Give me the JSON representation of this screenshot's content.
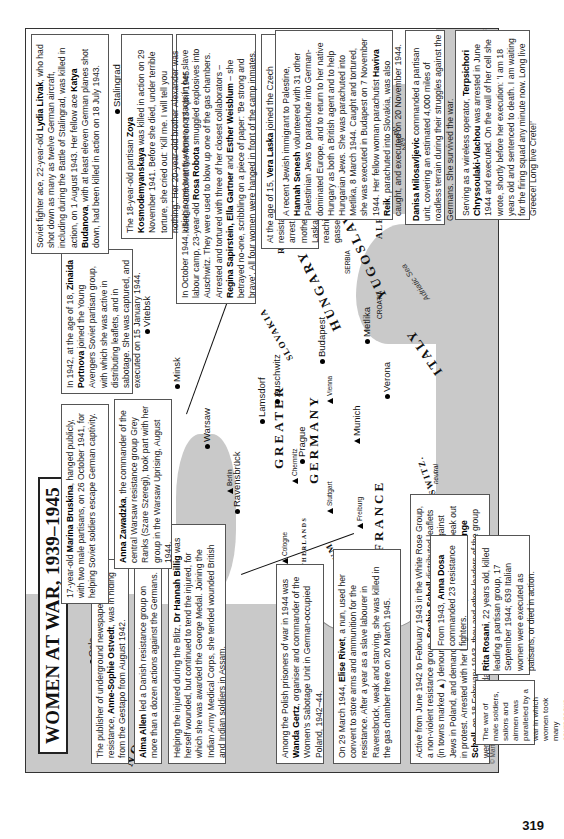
{
  "title": "WOMEN AT WAR, 1939–1945",
  "page_number": "319",
  "credit": "© Martin Gilbert 2008",
  "scale": {
    "km_label": "kilometres",
    "km_ticks": [
      "0",
      "300"
    ],
    "miles_label": "miles",
    "miles_ticks": [
      "0",
      "200"
    ]
  },
  "countries": [
    "NORWAY",
    "DENMARK",
    "THE NETHERLANDS",
    "BELGIUM",
    "FRANCE",
    "SWITZ.",
    "neutral",
    "GREATER",
    "GERMANY",
    "SOVIET UNION",
    "SLOVAKIA",
    "HUNGARY",
    "ROMANIA",
    "YUGOSLAVIA",
    "SERBIA",
    "CROATIA",
    "BULGARIA",
    "ALBANIA",
    "GREECE",
    "ITALY",
    "CRETE",
    "PALESTINE"
  ],
  "seas": [
    "Adriatic Sea",
    "Aegean Sea"
  ],
  "cities": {
    "dots": [
      "Oslo",
      "London",
      "Lyon",
      "Ravensbrück",
      "Warsaw",
      "Minsk",
      "Vitebsk",
      "Prague",
      "Lamsdorf",
      "Auschwitz",
      "Budapest",
      "Metlika",
      "Verona",
      "Osino-Gai",
      "Stalingrad"
    ],
    "triangles": [
      "Hamburg",
      "Cologne",
      "Berlin",
      "Chemnitz",
      "Stuttgart",
      "Freiburg",
      "Munich",
      "Vienna"
    ]
  },
  "boxes": {
    "ostvedt": {
      "pre": "The publisher of underground newspapers for the resistance, ",
      "name": "Anne-Sophie Ostvedt",
      "post": ", was in hiding from the Gestapo from August 1942."
    },
    "allen": {
      "pre": "",
      "name": "Alma Allen",
      "post": " led a Danish resistance group on more than a dozen actions against the Germans."
    },
    "billig": {
      "pre": "Helping the injured during the Blitz, ",
      "name": "Dr Hannah Billig",
      "post": " was herself wounded, but continued to tend the injured, for which she was awarded the George Medal. Joining the Indian Army Medical Corps, she tended wounded British and Indian soldiers in Assam."
    },
    "gertz": {
      "pre": "Among the Polish prisoners of war in 1944 was ",
      "name": "Wanda Gertz",
      "post": ", organiser and commander of the Women's Sabotage Unit in German-occupied Poland, 1942–44."
    },
    "rivet": {
      "pre": "On 29 March 1944, ",
      "name": "Elise Rivet",
      "post": ", a nun, used her convent to store arms and ammunition for the resistance. After a year as a slave labourer in Ravensbrück, weak and starving, she was killed in the gas chamber there on 20 March 1945."
    },
    "scholl": {
      "pre": "Active from June 1942 to February 1943 in the White Rose Group, a non-violent resistance group, ",
      "name": "Sophie Scholl",
      "post": " distributed leaflets (in towns marked ▲) denouncing 'bestial' Nazi atrocities against Jews in Poland, and demanded that the German people speak out in protest. Arrested with her brother Hans, and their sister ",
      "name2": "Inge Scholl",
      "post2": ", on 18 February 1943, they and other leaders of the group were executed four days later."
    },
    "summary": {
      "text": "The war of male soldiers, sailors and airmen was paralleled by a war in which women took many courageous parts. This map shows 24 individual examples of the women at war in Europe."
    },
    "bruskina": {
      "pre": "17-year-old ",
      "name": "Marina Bruskina",
      "post": ", hanged publicly, with two male partisans, on 26 October 1941, for helping Soviet soldiers escape German captivity."
    },
    "zawadzka": {
      "pre": "",
      "name": "Anna Zawadzka",
      "post": ", the commander of the central Warsaw resistance group Grey Ranks (Szare Szeregi), took part with her group in the Warsaw Uprising, August 1944."
    },
    "portnova": {
      "pre": "In 1942, at the age of 18, ",
      "name": "Zinaida Portnova",
      "post": " joined the Young Avengers Soviet partisan group, with which she was active in distributing leaflets, and in sabotage. She was captured, and executed on 15 January 1944."
    },
    "robota": {
      "pre": "In October 1944, using some twenty women contacts in her slave labour camp, 23-year-old ",
      "name": "Rosa Robota",
      "post": " smuggled explosives into Auschwitz. They were used to blow up one of the gas chambers. Arrested and tortured with three of her closest collaborators – ",
      "name2": "Regina Sapirstein, Ella Gartner",
      "mid": " and ",
      "name3": "Esther Weisblum",
      "post2": " – she betrayed no-one, scribbling on a piece of paper: 'Be strong and brave'. All four women were hanged in front of the camp inmates."
    },
    "kosmodemyanskaya": {
      "pre": "The 18-year-old partisan ",
      "name": "Zoya Kosmodemyanskaya",
      "post": " was killed in action on 29 November 1941. Before she died, under terrible torture, she cried out: 'Kill me. I will tell you nothing.' Her 20-year-old brother Alexander was killed in action at the front on 13 April 1945."
    },
    "litvak": {
      "pre": "Soviet fighter ace, 22-year-old ",
      "name": "Lydia Litvak",
      "post": ", who had shot down as many as twelve German aircraft, including during the Battle of Stalingrad, was killed in action, on 1 August 1943. Her fellow ace ",
      "name2": "Katya Budanova",
      "post2": ", with at least eleven German planes shot down, had been killed in action on 18 July 1943."
    },
    "laska": {
      "pre": "At the age of 15, ",
      "name": "Vera Laska",
      "post": " joined the Czech resistance, helping Jews and non-Jews to escape arrest. On the Nazis' 'most wanted' list, after her mother was arrested and taken to Auschwitz, Vera Laska surrendered, and was also taken to Auschwitz, reaching the camp on the day her mother was gassed. She survived the war."
    },
    "senesh": {
      "pre": "A recent Jewish immigrant to Palestine, ",
      "name": "Hannah Senesh",
      "post": " volunteered with 31 other Palestinian Jews to parachute into German-dominated Europe, and to return to her native Hungary as both a British agent and to help Hungarian Jews. She was parachuted into Metlika, 8 March 1944. Caught and tortured, she was executed in Budapest on 7 November 1944. Her fellow woman parachutist ",
      "name2": "Haviva Reik",
      "post2": ", parachuted into Slovakia, was also caught, and executed on 20 November 1944."
    },
    "milosavljevic": {
      "pre": "",
      "name": "Danisa Milosavljevic",
      "post": " commanded a partisan unit, covering an estimated 4,000 miles of roadless terrain during their struggles against the Germans. She survived the war."
    },
    "vlachou": {
      "pre": "Serving as a wireless operator, ",
      "name": "Terpsichori Chryssoulaki-Vlachou",
      "post": " was arrested in June 1944 and executed. On the wall of her cell she wrote, shortly before her execution: 'I am 18 years old and sentenced to death. I am waiting for the firing squad any minute now. Long live Greece! Long live Crete!'"
    },
    "dosa": {
      "pre": "From 1943, ",
      "name": "Anna Dosa",
      "post": " commanded 23 resistance fighters."
    },
    "rosani": {
      "pre": "",
      "name": "Rita Rosani",
      "post": ", 22 years old, killed leading a partisan group, 17 September 1944; 639 Italian women were executed as patisans, or died in action."
    }
  }
}
